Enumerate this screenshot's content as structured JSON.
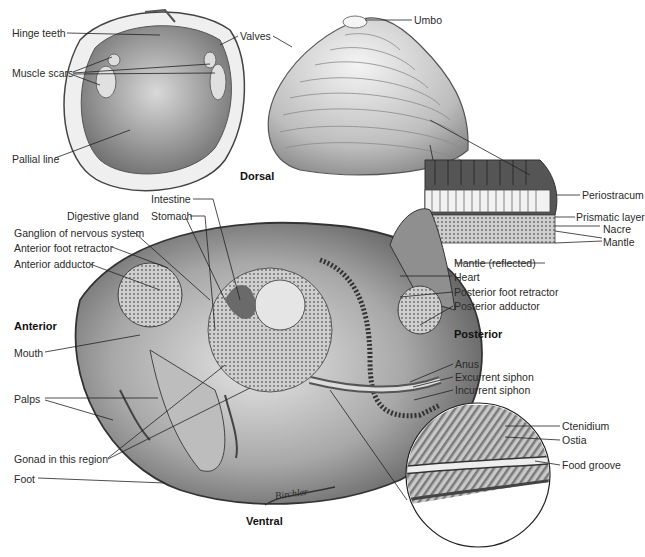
{
  "figure": {
    "caption_fragment": "g..."
  },
  "orientation": {
    "dorsal": "Dorsal",
    "ventral": "Ventral",
    "anterior": "Anterior",
    "posterior": "Posterior"
  },
  "shell_interior": {
    "labels": [
      "Hinge teeth",
      "Muscle scars",
      "Pallial line",
      "Valves"
    ]
  },
  "shell_exterior": {
    "labels": [
      "Umbo"
    ]
  },
  "shell_section": {
    "labels": [
      "Periostracum",
      "Prismatic layer",
      "Nacre",
      "Mantle"
    ]
  },
  "internal_anatomy": {
    "left_labels": [
      "Intestine",
      "Digestive gland",
      "Stomach",
      "Ganglion of nervous system",
      "Anterior foot retractor",
      "Anterior adductor",
      "Mouth",
      "Palps",
      "Gonad in this region",
      "Foot"
    ],
    "right_labels": [
      "Mantle (reflected)",
      "Heart",
      "Posterior foot retractor",
      "Posterior adductor",
      "Anus",
      "Excurrent siphon",
      "Incurrent siphon"
    ]
  },
  "gill_detail": {
    "labels": [
      "Ctenidium",
      "Ostia",
      "Food groove"
    ]
  },
  "signature": "Birchler"
}
